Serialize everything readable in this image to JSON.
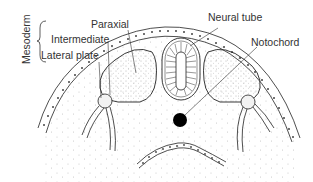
{
  "diagram": {
    "group_label": "Mesoderm",
    "labels": {
      "paraxial": "Paraxial",
      "intermediate": "Intermediate",
      "lateral_plate": "Lateral plate",
      "neural_tube": "Neural tube",
      "notochord": "Notochord"
    },
    "colors": {
      "line": "#222222",
      "stipple": "#888888",
      "notochord": "#000000",
      "background": "#ffffff"
    }
  }
}
